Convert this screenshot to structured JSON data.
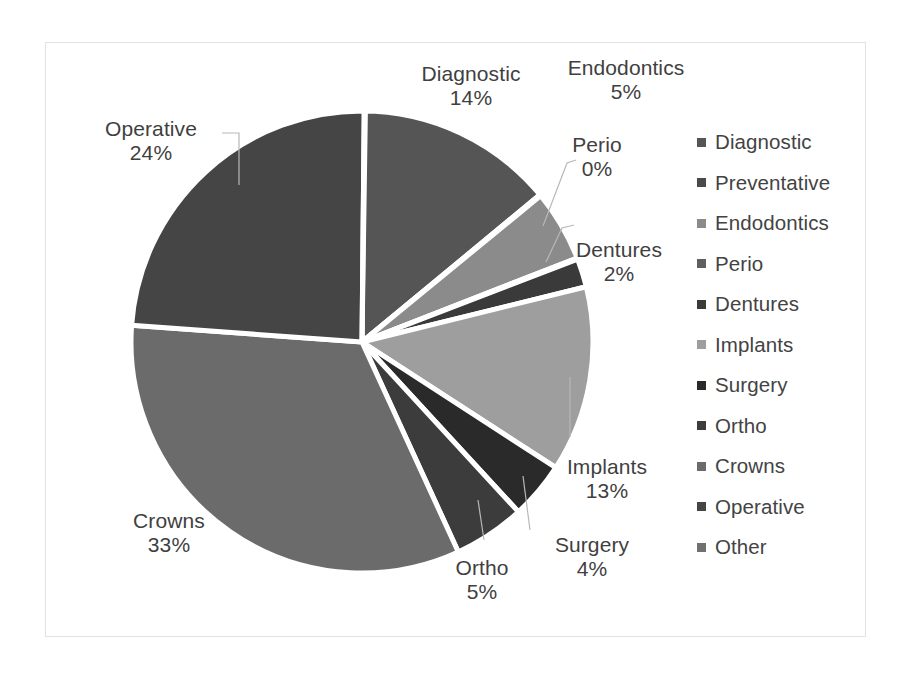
{
  "chart_data": {
    "type": "pie",
    "title": "",
    "categories": [
      "Diagnostic",
      "Preventative",
      "Endodontics",
      "Perio",
      "Dentures",
      "Implants",
      "Surgery",
      "Ortho",
      "Crowns",
      "Operative",
      "Other"
    ],
    "values": [
      14,
      0,
      5,
      0,
      2,
      13,
      4,
      5,
      33,
      24,
      0
    ],
    "value_labels": [
      "14%",
      "0%",
      "5%",
      "0%",
      "2%",
      "13%",
      "4%",
      "5%",
      "33%",
      "24%",
      "0%"
    ],
    "colors": [
      "#555555",
      "#4a4a4a",
      "#8b8b8b",
      "#5f5f5f",
      "#3a3a3a",
      "#9e9e9e",
      "#2a2a2a",
      "#3c3c3c",
      "#6b6b6b",
      "#454545",
      "#707070"
    ],
    "legend_position": "right",
    "grid": false,
    "start_angle_deg": 0,
    "direction": "clockwise"
  },
  "labels": [
    {
      "name": "Diagnostic",
      "pct": "14%"
    },
    {
      "name": "Endodontics",
      "pct": "5%"
    },
    {
      "name": "Perio",
      "pct": "0%"
    },
    {
      "name": "Dentures",
      "pct": "2%"
    },
    {
      "name": "Implants",
      "pct": "13%"
    },
    {
      "name": "Surgery",
      "pct": "4%"
    },
    {
      "name": "Ortho",
      "pct": "5%"
    },
    {
      "name": "Crowns",
      "pct": "33%"
    },
    {
      "name": "Operative",
      "pct": "24%"
    }
  ],
  "legend": {
    "items": [
      {
        "label": "Diagnostic",
        "color": "#555555"
      },
      {
        "label": "Preventative",
        "color": "#4a4a4a"
      },
      {
        "label": "Endodontics",
        "color": "#8b8b8b"
      },
      {
        "label": "Perio",
        "color": "#5f5f5f"
      },
      {
        "label": "Dentures",
        "color": "#3a3a3a"
      },
      {
        "label": "Implants",
        "color": "#9e9e9e"
      },
      {
        "label": "Surgery",
        "color": "#2a2a2a"
      },
      {
        "label": "Ortho",
        "color": "#3c3c3c"
      },
      {
        "label": "Crowns",
        "color": "#6b6b6b"
      },
      {
        "label": "Operative",
        "color": "#454545"
      },
      {
        "label": "Other",
        "color": "#707070"
      }
    ]
  }
}
